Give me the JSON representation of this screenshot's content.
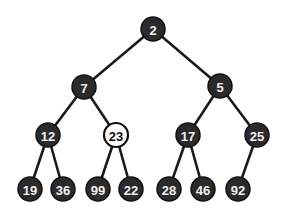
{
  "tree": {
    "nodes": [
      {
        "id": "n0",
        "value": "2",
        "x": 153,
        "y": 29,
        "style": "dark"
      },
      {
        "id": "n1",
        "value": "7",
        "x": 84,
        "y": 87,
        "style": "dark"
      },
      {
        "id": "n2",
        "value": "5",
        "x": 220,
        "y": 86,
        "style": "dark"
      },
      {
        "id": "n3",
        "value": "12",
        "x": 48,
        "y": 135,
        "style": "dark"
      },
      {
        "id": "n4",
        "value": "23",
        "x": 116,
        "y": 135,
        "style": "light"
      },
      {
        "id": "n5",
        "value": "17",
        "x": 188,
        "y": 135,
        "style": "dark"
      },
      {
        "id": "n6",
        "value": "25",
        "x": 257,
        "y": 135,
        "style": "dark"
      },
      {
        "id": "n7",
        "value": "19",
        "x": 30,
        "y": 189,
        "style": "dark"
      },
      {
        "id": "n8",
        "value": "36",
        "x": 63,
        "y": 189,
        "style": "dark"
      },
      {
        "id": "n9",
        "value": "99",
        "x": 98,
        "y": 189,
        "style": "dark"
      },
      {
        "id": "n10",
        "value": "22",
        "x": 131,
        "y": 189,
        "style": "dark"
      },
      {
        "id": "n11",
        "value": "28",
        "x": 169,
        "y": 189,
        "style": "dark"
      },
      {
        "id": "n12",
        "value": "46",
        "x": 203,
        "y": 189,
        "style": "dark"
      },
      {
        "id": "n13",
        "value": "92",
        "x": 238,
        "y": 189,
        "style": "dark"
      }
    ],
    "edges": [
      [
        "n0",
        "n1"
      ],
      [
        "n0",
        "n2"
      ],
      [
        "n1",
        "n3"
      ],
      [
        "n1",
        "n4"
      ],
      [
        "n2",
        "n5"
      ],
      [
        "n2",
        "n6"
      ],
      [
        "n3",
        "n7"
      ],
      [
        "n3",
        "n8"
      ],
      [
        "n4",
        "n9"
      ],
      [
        "n4",
        "n10"
      ],
      [
        "n5",
        "n11"
      ],
      [
        "n5",
        "n12"
      ],
      [
        "n6",
        "n13"
      ]
    ],
    "highlighted_node": "23",
    "colors": {
      "node_fill": "#2a2a2a",
      "highlight_fill": "#ffffff",
      "edge": "#1a1a1a"
    }
  }
}
